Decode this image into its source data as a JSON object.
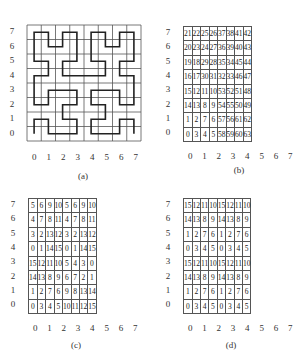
{
  "panels": {
    "a": {
      "caption": "(a)",
      "title": "Hilbert curve on 8x8 grid",
      "y_labels": [
        "7",
        "6",
        "5",
        "4",
        "3",
        "2",
        "1",
        "0"
      ],
      "x_labels": [
        "0",
        "1",
        "2",
        "3",
        "4",
        "5",
        "6",
        "7"
      ],
      "path": [
        [
          0,
          0
        ],
        [
          0,
          1
        ],
        [
          1,
          1
        ],
        [
          1,
          0
        ],
        [
          2,
          0
        ],
        [
          3,
          0
        ],
        [
          3,
          1
        ],
        [
          2,
          1
        ],
        [
          2,
          2
        ],
        [
          3,
          2
        ],
        [
          3,
          3
        ],
        [
          2,
          3
        ],
        [
          1,
          3
        ],
        [
          1,
          2
        ],
        [
          0,
          2
        ],
        [
          0,
          3
        ],
        [
          0,
          4
        ],
        [
          1,
          4
        ],
        [
          1,
          5
        ],
        [
          0,
          5
        ],
        [
          0,
          6
        ],
        [
          0,
          7
        ],
        [
          1,
          7
        ],
        [
          1,
          6
        ],
        [
          2,
          6
        ],
        [
          2,
          7
        ],
        [
          3,
          7
        ],
        [
          3,
          6
        ],
        [
          3,
          5
        ],
        [
          2,
          5
        ],
        [
          2,
          4
        ],
        [
          3,
          4
        ],
        [
          4,
          4
        ],
        [
          5,
          4
        ],
        [
          5,
          5
        ],
        [
          4,
          5
        ],
        [
          4,
          6
        ],
        [
          4,
          7
        ],
        [
          5,
          7
        ],
        [
          5,
          6
        ],
        [
          6,
          6
        ],
        [
          6,
          7
        ],
        [
          7,
          7
        ],
        [
          7,
          6
        ],
        [
          7,
          5
        ],
        [
          6,
          5
        ],
        [
          6,
          4
        ],
        [
          7,
          4
        ],
        [
          7,
          3
        ],
        [
          7,
          2
        ],
        [
          6,
          2
        ],
        [
          6,
          3
        ],
        [
          5,
          3
        ],
        [
          4,
          3
        ],
        [
          4,
          2
        ],
        [
          5,
          2
        ],
        [
          5,
          1
        ],
        [
          4,
          1
        ],
        [
          4,
          0
        ],
        [
          5,
          0
        ],
        [
          6,
          0
        ],
        [
          6,
          1
        ],
        [
          7,
          1
        ],
        [
          7,
          0
        ]
      ]
    },
    "b": {
      "caption": "(b)",
      "y_labels": [
        "7",
        "6",
        "5",
        "4",
        "3",
        "2",
        "1",
        "0"
      ],
      "x_labels": [
        "0",
        "1",
        "2",
        "3",
        "4",
        "5",
        "6",
        "7"
      ],
      "rows": [
        [
          "21",
          "22",
          "25",
          "26",
          "37",
          "38",
          "41",
          "42"
        ],
        [
          "20",
          "23",
          "24",
          "27",
          "36",
          "39",
          "40",
          "43"
        ],
        [
          "19",
          "18",
          "29",
          "28",
          "35",
          "34",
          "45",
          "44"
        ],
        [
          "16",
          "17",
          "30",
          "31",
          "32",
          "33",
          "46",
          "47"
        ],
        [
          "15",
          "12",
          "11",
          "10",
          "53",
          "52",
          "51",
          "48"
        ],
        [
          "14",
          "13",
          "8",
          "9",
          "54",
          "55",
          "50",
          "49"
        ],
        [
          "1",
          "2",
          "7",
          "6",
          "57",
          "56",
          "61",
          "62"
        ],
        [
          "0",
          "3",
          "4",
          "5",
          "58",
          "59",
          "60",
          "63"
        ]
      ]
    },
    "c": {
      "caption": "(c)",
      "y_labels": [
        "7",
        "6",
        "5",
        "4",
        "3",
        "2",
        "1",
        "0"
      ],
      "x_labels": [
        "0",
        "1",
        "2",
        "3",
        "4",
        "5",
        "6",
        "7"
      ],
      "rows": [
        [
          "5",
          "6",
          "9",
          "10",
          "5",
          "6",
          "9",
          "10"
        ],
        [
          "4",
          "7",
          "8",
          "11",
          "4",
          "7",
          "8",
          "11"
        ],
        [
          "3",
          "2",
          "13",
          "12",
          "3",
          "2",
          "13",
          "12"
        ],
        [
          "0",
          "1",
          "14",
          "15",
          "0",
          "1",
          "14",
          "15"
        ],
        [
          "15",
          "12",
          "11",
          "10",
          "5",
          "4",
          "3",
          "0"
        ],
        [
          "14",
          "13",
          "8",
          "9",
          "6",
          "7",
          "2",
          "1"
        ],
        [
          "1",
          "2",
          "7",
          "6",
          "9",
          "8",
          "13",
          "14"
        ],
        [
          "0",
          "3",
          "4",
          "5",
          "10",
          "11",
          "12",
          "15"
        ]
      ]
    },
    "d": {
      "caption": "(d)",
      "y_labels": [
        "7",
        "6",
        "5",
        "4",
        "3",
        "2",
        "1",
        "0"
      ],
      "x_labels": [
        "0",
        "1",
        "2",
        "3",
        "4",
        "5",
        "6",
        "7"
      ],
      "rows": [
        [
          "15",
          "12",
          "11",
          "10",
          "15",
          "12",
          "11",
          "10"
        ],
        [
          "14",
          "13",
          "8",
          "9",
          "14",
          "13",
          "8",
          "9"
        ],
        [
          "1",
          "2",
          "7",
          "6",
          "1",
          "2",
          "7",
          "6"
        ],
        [
          "0",
          "3",
          "4",
          "5",
          "0",
          "3",
          "4",
          "5"
        ],
        [
          "15",
          "12",
          "11",
          "10",
          "15",
          "12",
          "11",
          "10"
        ],
        [
          "14",
          "13",
          "8",
          "9",
          "14",
          "13",
          "8",
          "9"
        ],
        [
          "1",
          "2",
          "7",
          "6",
          "1",
          "2",
          "7",
          "6"
        ],
        [
          "0",
          "3",
          "4",
          "5",
          "0",
          "3",
          "4",
          "5"
        ]
      ]
    }
  },
  "colors": {
    "line": "#222222",
    "grid": "#555555",
    "text": "#333333",
    "background": "#ffffff"
  }
}
